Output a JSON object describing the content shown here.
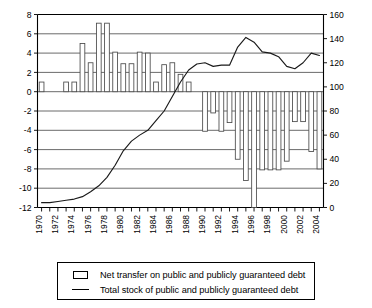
{
  "chart_data": {
    "type": "bar",
    "title": "",
    "subtitle": "",
    "xlabel": "",
    "ylabel": "",
    "y2label": "",
    "grid": true,
    "legend_position": "bottom",
    "x": [
      1970,
      1971,
      1972,
      1973,
      1974,
      1975,
      1976,
      1977,
      1978,
      1979,
      1980,
      1981,
      1982,
      1983,
      1984,
      1985,
      1986,
      1987,
      1988,
      1989,
      1990,
      1991,
      1992,
      1993,
      1994,
      1995,
      1996,
      1997,
      1998,
      1999,
      2000,
      2001,
      2002,
      2003,
      2004
    ],
    "xtick_labels": [
      "1970",
      "1972",
      "1974",
      "1976",
      "1978",
      "1980",
      "1982",
      "1984",
      "1986",
      "1988",
      "1990",
      "1992",
      "1994",
      "1996",
      "1998",
      "2000",
      "2002",
      "2004"
    ],
    "ylim": [
      -12,
      8
    ],
    "ytick_labels": [
      "8",
      "6",
      "4",
      "2",
      "0",
      "-2",
      "-4",
      "-6",
      "-8",
      "-10",
      "-12"
    ],
    "ytick_values": [
      8,
      6,
      4,
      2,
      0,
      -2,
      -4,
      -6,
      -8,
      -10,
      -12
    ],
    "y2lim": [
      0,
      160
    ],
    "y2tick_labels": [
      "160",
      "140",
      "120",
      "100",
      "80",
      "60",
      "40",
      "20",
      "0"
    ],
    "y2tick_values": [
      160,
      140,
      120,
      100,
      80,
      60,
      40,
      20,
      0
    ],
    "series": [
      {
        "name": "Net transfer on public and publicly guaranteed debt",
        "type": "bar",
        "axis": "left",
        "values": [
          1.0,
          0.0,
          0.0,
          1.0,
          1.0,
          5.0,
          3.0,
          7.1,
          7.1,
          4.1,
          2.9,
          2.9,
          4.1,
          4.0,
          1.0,
          2.8,
          3.0,
          1.8,
          1.0,
          0.0,
          -4.1,
          -2.2,
          -4.1,
          -3.2,
          -7.0,
          -9.2,
          -14.0,
          -8.1,
          -8.1,
          -8.1,
          -7.2,
          -3.1,
          -3.1,
          -6.2,
          -8.0
        ]
      },
      {
        "name": "Total stock of public and publicly guaranteed debt",
        "type": "line",
        "axis": "right",
        "values": [
          4,
          4,
          5,
          6,
          7,
          9,
          13,
          18,
          25,
          35,
          47,
          55,
          60,
          64,
          72,
          80,
          92,
          104,
          114,
          119,
          120,
          117,
          118,
          118,
          133,
          141,
          137,
          129,
          128,
          125,
          117,
          115,
          120,
          128,
          126
        ]
      }
    ]
  },
  "legend": {
    "items": [
      {
        "key": "bar-swatch",
        "label": "Net transfer on public and publicly guaranteed debt"
      },
      {
        "key": "line-dash",
        "label": "Total stock of public and publicly guaranteed debt"
      }
    ]
  }
}
